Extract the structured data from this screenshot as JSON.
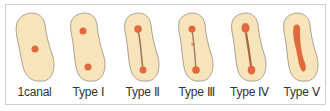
{
  "diagram": {
    "colors": {
      "tooth_fill": "#f8e4bb",
      "tooth_outline": "#a8a293",
      "canal": "#e06a3c",
      "canal_line": "#9c7b5f",
      "frame_border": "#cfcfcf"
    },
    "types": [
      {
        "label": "1canal",
        "canals": "single centered canal"
      },
      {
        "label": "Type Ⅰ",
        "canals": "two separate canals"
      },
      {
        "label": "Type Ⅱ",
        "canals": "two canals connected by a thin isthmus"
      },
      {
        "label": "Type Ⅲ",
        "canals": "two canals connected by an incomplete isthmus"
      },
      {
        "label": "Type Ⅳ",
        "canals": "two canals with a continuous isthmus"
      },
      {
        "label": "Type Ⅴ",
        "canals": "single continuous ribbon-shaped canal"
      }
    ]
  }
}
